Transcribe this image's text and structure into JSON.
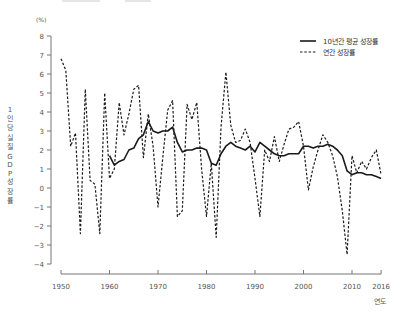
{
  "chart_data": {
    "type": "line",
    "title": "",
    "xlabel": "연도",
    "ylabel": "1인당 실질 GDP 성장률",
    "y_unit": "(%)",
    "xlim": [
      1950,
      2016
    ],
    "ylim": [
      -4,
      8
    ],
    "x_ticks": [
      1950,
      1960,
      1970,
      1980,
      1990,
      2000,
      2010,
      2016
    ],
    "y_ticks": [
      8,
      7,
      6,
      5,
      4,
      3,
      2,
      1,
      0,
      -1,
      -2,
      -3,
      -4
    ],
    "grid": false,
    "legend_position": "top-right",
    "series": [
      {
        "name": "10년간 평균 성장률",
        "style": "solid",
        "x": [
          1960,
          1961,
          1962,
          1963,
          1964,
          1965,
          1966,
          1967,
          1968,
          1969,
          1970,
          1971,
          1972,
          1973,
          1974,
          1975,
          1976,
          1977,
          1978,
          1979,
          1980,
          1981,
          1982,
          1983,
          1984,
          1985,
          1986,
          1987,
          1988,
          1989,
          1990,
          1991,
          1992,
          1993,
          1994,
          1995,
          1996,
          1997,
          1998,
          1999,
          2000,
          2001,
          2002,
          2003,
          2004,
          2005,
          2006,
          2007,
          2008,
          2009,
          2010,
          2011,
          2012,
          2013,
          2014,
          2015,
          2016
        ],
        "values": [
          1.7,
          1.2,
          1.4,
          1.5,
          2.0,
          2.1,
          2.6,
          2.8,
          3.5,
          3.0,
          2.9,
          3.0,
          3.0,
          3.2,
          2.4,
          1.9,
          2.0,
          2.0,
          2.1,
          2.1,
          2.0,
          1.3,
          1.2,
          1.8,
          2.2,
          2.4,
          2.2,
          2.1,
          2.0,
          2.2,
          1.9,
          2.4,
          2.2,
          2.0,
          1.8,
          1.7,
          1.7,
          1.8,
          1.8,
          1.8,
          2.2,
          2.2,
          2.1,
          2.2,
          2.2,
          2.3,
          2.2,
          2.0,
          1.7,
          0.9,
          0.7,
          0.8,
          0.8,
          0.7,
          0.7,
          0.6,
          0.5
        ]
      },
      {
        "name": "연간 성장률",
        "style": "dashed",
        "x": [
          1950,
          1951,
          1952,
          1953,
          1954,
          1955,
          1956,
          1957,
          1958,
          1959,
          1960,
          1961,
          1962,
          1963,
          1964,
          1965,
          1966,
          1967,
          1968,
          1969,
          1970,
          1971,
          1972,
          1973,
          1974,
          1975,
          1976,
          1977,
          1978,
          1979,
          1980,
          1981,
          1982,
          1983,
          1984,
          1985,
          1986,
          1987,
          1988,
          1989,
          1990,
          1991,
          1992,
          1993,
          1994,
          1995,
          1996,
          1997,
          1998,
          1999,
          2000,
          2001,
          2002,
          2003,
          2004,
          2005,
          2006,
          2007,
          2008,
          2009,
          2010,
          2011,
          2012,
          2013,
          2014,
          2015,
          2016
        ],
        "values": [
          6.8,
          6.2,
          2.2,
          2.9,
          -2.4,
          5.2,
          0.4,
          0.2,
          -2.4,
          5.0,
          0.5,
          1.0,
          4.5,
          2.8,
          3.9,
          5.2,
          5.4,
          1.6,
          3.9,
          2.2,
          -1.0,
          1.6,
          4.1,
          4.6,
          -1.5,
          -1.2,
          4.4,
          3.6,
          4.5,
          1.0,
          -1.5,
          1.3,
          -2.6,
          3.2,
          6.1,
          3.3,
          2.4,
          2.5,
          3.1,
          2.4,
          0.5,
          -1.5,
          2.0,
          1.4,
          2.7,
          1.4,
          2.3,
          3.1,
          3.2,
          3.5,
          2.2,
          -0.1,
          1.1,
          2.0,
          2.8,
          2.4,
          1.7,
          0.6,
          -1.2,
          -3.5,
          1.7,
          0.8,
          1.4,
          1.0,
          1.6,
          2.0,
          0.7
        ]
      }
    ]
  },
  "legend": {
    "items": [
      {
        "label": "10년간 평균 성장률",
        "style": "solid"
      },
      {
        "label": "연간 성장률",
        "style": "dashed"
      }
    ]
  },
  "axes": {
    "y_unit": "(%)",
    "y_label": "1인당 실질 GDP 성장률",
    "x_label": "연도"
  },
  "colors": {
    "line": "#1a1a1a",
    "axis": "#777777",
    "text": "#555555"
  }
}
